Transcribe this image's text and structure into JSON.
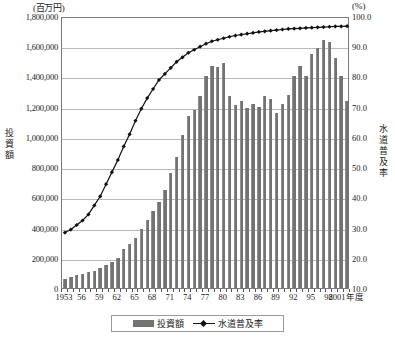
{
  "units": {
    "left": "(百万円)",
    "right": "(%)"
  },
  "axis_titles": {
    "left": "投資額",
    "right": "水道普及率"
  },
  "legend": {
    "bar_label": "投資額",
    "line_label": "水道普及率"
  },
  "xaxis_suffix": "年度",
  "colors": {
    "bar": "#737373",
    "line": "#111111",
    "grid": "#b9b9b9",
    "frame": "#7a7a7a"
  },
  "chart_data": {
    "type": "bar",
    "title": "",
    "subtitle": "",
    "xlabel": "年度",
    "ylabel": "投資額",
    "y2label": "水道普及率",
    "ylim": [
      0,
      1800000
    ],
    "y2lim": [
      10.0,
      100.0
    ],
    "yticks": [
      "0",
      "200,000",
      "400,000",
      "600,000",
      "800,000",
      "1,000,000",
      "1,200,000",
      "1,400,000",
      "1,600,000",
      "1,800,000"
    ],
    "ytick_values": [
      0,
      200000,
      400000,
      600000,
      800000,
      1000000,
      1200000,
      1400000,
      1600000,
      1800000
    ],
    "y2ticks": [
      "10.0",
      "20.0",
      "30.0",
      "40.0",
      "50.0",
      "60.0",
      "70.0",
      "80.0",
      "90.0",
      "100.0"
    ],
    "y2tick_values": [
      10.0,
      20.0,
      30.0,
      40.0,
      50.0,
      60.0,
      70.0,
      80.0,
      90.0,
      100.0
    ],
    "grid": true,
    "legend_position": "bottom",
    "xtick_labels": [
      "1953",
      "56",
      "59",
      "62",
      "65",
      "68",
      "71",
      "74",
      "77",
      "80",
      "83",
      "86",
      "89",
      "92",
      "95",
      "98",
      "2001年度"
    ],
    "xtick_years": [
      1953,
      1956,
      1959,
      1962,
      1965,
      1968,
      1971,
      1974,
      1977,
      1980,
      1983,
      1986,
      1989,
      1992,
      1995,
      1998,
      2001
    ],
    "categories": [
      1953,
      1954,
      1955,
      1956,
      1957,
      1958,
      1959,
      1960,
      1961,
      1962,
      1963,
      1964,
      1965,
      1966,
      1967,
      1968,
      1969,
      1970,
      1971,
      1972,
      1973,
      1974,
      1975,
      1976,
      1977,
      1978,
      1979,
      1980,
      1981,
      1982,
      1983,
      1984,
      1985,
      1986,
      1987,
      1988,
      1989,
      1990,
      1991,
      1992,
      1993,
      1994,
      1995,
      1996,
      1997,
      1998,
      1999,
      2000,
      2001
    ],
    "series": [
      {
        "name": "投資額",
        "type": "bar",
        "axis": "left",
        "unit": "百万円",
        "values": [
          60000,
          75000,
          85000,
          95000,
          105000,
          115000,
          130000,
          150000,
          175000,
          200000,
          255000,
          290000,
          330000,
          390000,
          450000,
          510000,
          570000,
          650000,
          760000,
          870000,
          1010000,
          1140000,
          1180000,
          1270000,
          1400000,
          1470000,
          1460000,
          1490000,
          1270000,
          1210000,
          1240000,
          1190000,
          1220000,
          1200000,
          1270000,
          1250000,
          1160000,
          1220000,
          1280000,
          1400000,
          1470000,
          1400000,
          1550000,
          1590000,
          1640000,
          1630000,
          1520000,
          1400000,
          1240000
        ]
      },
      {
        "name": "水道普及率",
        "type": "line",
        "axis": "right",
        "unit": "%",
        "values": [
          29.0,
          30.0,
          31.5,
          33.0,
          35.0,
          38.0,
          41.0,
          45.0,
          49.0,
          53.0,
          57.5,
          61.5,
          66.0,
          70.0,
          73.5,
          76.5,
          79.5,
          81.5,
          83.5,
          85.5,
          87.0,
          88.5,
          89.5,
          90.5,
          91.5,
          92.3,
          92.8,
          93.3,
          93.8,
          94.2,
          94.5,
          94.8,
          95.1,
          95.4,
          95.6,
          95.8,
          96.0,
          96.2,
          96.4,
          96.5,
          96.6,
          96.7,
          96.8,
          96.9,
          97.0,
          97.1,
          97.2,
          97.2,
          97.3
        ]
      }
    ]
  }
}
